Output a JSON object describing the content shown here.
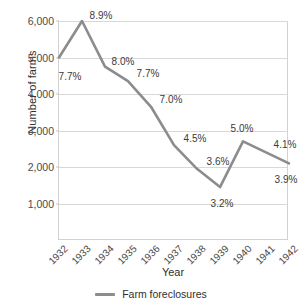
{
  "chart_data": {
    "type": "line",
    "title": "",
    "xlabel": "Year",
    "ylabel": "Number of farms",
    "categories": [
      "1932",
      "1933",
      "1934",
      "1935",
      "1936",
      "1937",
      "1938",
      "1939",
      "1940",
      "1941",
      "1942"
    ],
    "series": [
      {
        "name": "Farm foreclosures",
        "color": "#8c8c8c",
        "values": [
          5000,
          6000,
          4750,
          4350,
          3650,
          2600,
          1950,
          1450,
          2700,
          2400,
          2100
        ],
        "point_labels": [
          "7.7%",
          "8.9%",
          "8.0%",
          "7.7%",
          "7.0%",
          "4.5%",
          "3.6%",
          "3.2%",
          "5.0%",
          "4.1%",
          "3.9%"
        ]
      }
    ],
    "ylim": [
      0,
      6000
    ],
    "yticks": [
      1000,
      2000,
      3000,
      4000,
      5000,
      6000
    ],
    "ytick_labels": [
      "1,000",
      "2,000",
      "3,000",
      "4,000",
      "5,000",
      "6,000"
    ],
    "grid": true,
    "legend_position": "bottom"
  },
  "legend": {
    "entries": [
      {
        "label": "Farm foreclosures",
        "color": "#8c8c8c"
      }
    ]
  },
  "label_offsets": [
    {
      "dx": 12,
      "dy": 18
    },
    {
      "dx": 20,
      "dy": -6
    },
    {
      "dx": 19,
      "dy": -6
    },
    {
      "dx": 21,
      "dy": -8
    },
    {
      "dx": 21,
      "dy": -8
    },
    {
      "dx": 22,
      "dy": -7
    },
    {
      "dx": 22,
      "dy": -8
    },
    {
      "dx": 3,
      "dy": 16
    },
    {
      "dx": 0,
      "dy": -13
    },
    {
      "dx": 20,
      "dy": -8
    },
    {
      "dx": -2,
      "dy": 16
    }
  ]
}
